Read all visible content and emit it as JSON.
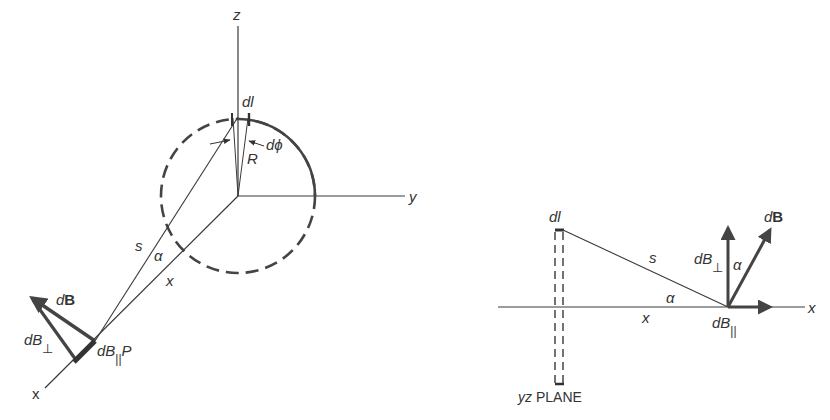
{
  "left_figure": {
    "axes": {
      "z": "z",
      "y": "y",
      "x": "x"
    },
    "labels": {
      "dl": "dl",
      "dphi": "dϕ",
      "R": "R",
      "s": "s",
      "alpha": "α",
      "x_dist": "x",
      "dB_d": "d",
      "dB_B": "B",
      "dBperp_main": "dB",
      "dBperp_sub": "⊥",
      "dBpar_main": "dB",
      "dBpar_sub": "||",
      "P": "P"
    }
  },
  "right_figure": {
    "labels": {
      "dl": "dl",
      "s": "s",
      "alpha_bottom": "α",
      "alpha_top": "α",
      "x_dist": "x",
      "x_axis": "x",
      "dB_d": "d",
      "dB_B": "B",
      "dBperp_main": "dB",
      "dBperp_sub": "⊥",
      "dBpar_main": "dB",
      "dBpar_sub": "||",
      "plane_yz": "yz",
      "plane_word": "PLANE"
    }
  },
  "colors": {
    "line": "#3a3a3a",
    "arrow": "#444444",
    "text": "#333333"
  }
}
